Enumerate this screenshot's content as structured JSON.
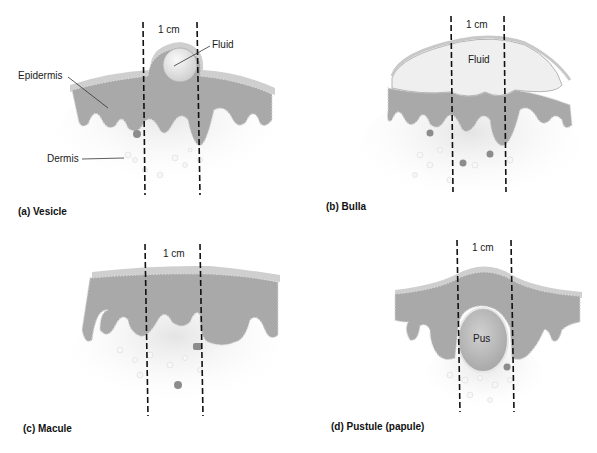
{
  "figure": {
    "panels": [
      {
        "id": "a",
        "caption": "(a) Vesicle",
        "scale_label": "1 cm",
        "labels": {
          "fluid": "Fluid",
          "epidermis": "Epidermis",
          "dermis": "Dermis"
        }
      },
      {
        "id": "b",
        "caption": "(b) Bulla",
        "scale_label": "1 cm",
        "labels": {
          "fluid": "Fluid"
        }
      },
      {
        "id": "c",
        "caption": "(c) Macule",
        "scale_label": "1 cm"
      },
      {
        "id": "d",
        "caption": "(d) Pustule (papule)",
        "scale_label": "1 cm",
        "labels": {
          "pus": "Pus"
        }
      }
    ],
    "colors": {
      "epidermis": "#a9a9a9",
      "stratum_corneum": "#cfcfcf",
      "dermis": "#ececec",
      "fluid": "#efefef",
      "dashed_lines": "#111111"
    }
  }
}
